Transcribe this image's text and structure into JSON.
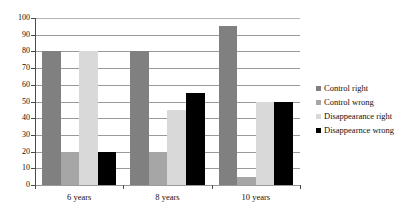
{
  "chart_data": {
    "type": "bar",
    "title": "",
    "xlabel": "",
    "ylabel": "",
    "ylim": [
      0,
      100
    ],
    "ytick_step": 10,
    "yticks": [
      "0",
      "10",
      "20",
      "30",
      "40",
      "50",
      "60",
      "70",
      "80",
      "90",
      "100"
    ],
    "grid": true,
    "legend_position": "right",
    "categories": [
      "6 years",
      "8 years",
      "10 years"
    ],
    "series": [
      {
        "name": "Control right",
        "color": "#808080",
        "values": [
          80,
          80,
          95
        ]
      },
      {
        "name": "Control wrong",
        "color": "#a6a6a6",
        "values": [
          20,
          20,
          5
        ]
      },
      {
        "name": "Disappearance right",
        "color": "#d9d9d9",
        "values": [
          80,
          45,
          50
        ]
      },
      {
        "name": "Disappearnce wrong",
        "color": "#000000",
        "values": [
          20,
          55,
          50
        ]
      }
    ]
  },
  "legend": {
    "items": [
      {
        "label": "Control right",
        "color": "#808080"
      },
      {
        "label": "Control wrong",
        "color": "#a6a6a6"
      },
      {
        "label": "Disappearance right",
        "color": "#d9d9d9"
      },
      {
        "label": "Disappearnce wrong",
        "color": "#000000"
      }
    ]
  },
  "colors": {
    "axis": "#4a4a4a",
    "grid": "#9a9a9a",
    "text": "#111111",
    "background": "#ffffff"
  }
}
